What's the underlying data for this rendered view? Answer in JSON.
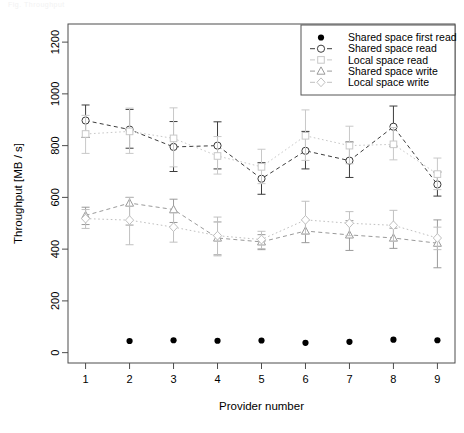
{
  "figure": {
    "ghost_header": "Fig.  Throughput",
    "width": 464,
    "height": 433,
    "background": "#ffffff"
  },
  "axes": {
    "x_label": "Provider number",
    "y_label": "Throughput [MB / s]",
    "x_ticks": [
      "1",
      "2",
      "3",
      "4",
      "5",
      "6",
      "7",
      "8",
      "9"
    ],
    "y_ticks": [
      "0",
      "200",
      "400",
      "600",
      "800",
      "1000",
      "1200"
    ]
  },
  "legend": {
    "items": [
      {
        "label": "Shared space first read",
        "marker": "filled-circle",
        "color": "#000000",
        "line": "none"
      },
      {
        "label": "Shared space read",
        "marker": "open-circle",
        "color": "#3c3c3c",
        "line": "dashed"
      },
      {
        "label": "Local space read",
        "marker": "open-square",
        "color": "#c8c8c8",
        "line": "dotted"
      },
      {
        "label": "Shared space write",
        "marker": "open-triangle",
        "color": "#9a9a9a",
        "line": "dashed"
      },
      {
        "label": "Local space write",
        "marker": "open-diamond",
        "color": "#c0c0c0",
        "line": "dotted"
      }
    ]
  },
  "chart_data": {
    "type": "line",
    "title": "",
    "xlabel": "Provider number",
    "ylabel": "Throughput [MB / s]",
    "x": [
      1,
      2,
      3,
      4,
      5,
      6,
      7,
      8,
      9
    ],
    "xlim": [
      0.6,
      9.4
    ],
    "ylim": [
      -40,
      1270
    ],
    "grid": false,
    "legend_position": "top-right",
    "series": [
      {
        "name": "Shared space first read",
        "marker": "filled-circle",
        "color": "#000000",
        "line": "none",
        "x": [
          2,
          3,
          4,
          5,
          6,
          7,
          8,
          9
        ],
        "values": [
          45,
          48,
          46,
          47,
          38,
          42,
          50,
          48
        ],
        "err_low": [
          0,
          0,
          0,
          0,
          0,
          0,
          0,
          0
        ],
        "err_high": [
          0,
          0,
          0,
          0,
          0,
          0,
          0,
          0
        ]
      },
      {
        "name": "Shared space read",
        "marker": "open-circle",
        "color": "#3c3c3c",
        "line": "dashed",
        "x": [
          1,
          2,
          3,
          4,
          5,
          6,
          7,
          8,
          9
        ],
        "values": [
          897,
          862,
          795,
          800,
          672,
          780,
          742,
          873,
          650
        ],
        "err_low": [
          65,
          72,
          95,
          90,
          60,
          70,
          65,
          75,
          45
        ],
        "err_high": [
          60,
          78,
          98,
          92,
          62,
          75,
          72,
          80,
          48
        ]
      },
      {
        "name": "Local space read",
        "marker": "open-square",
        "color": "#c8c8c8",
        "line": "dotted",
        "x": [
          1,
          2,
          3,
          4,
          5,
          6,
          7,
          8,
          9
        ],
        "values": [
          845,
          855,
          828,
          760,
          718,
          838,
          800,
          805,
          690
        ],
        "err_low": [
          75,
          85,
          110,
          70,
          65,
          95,
          70,
          60,
          60
        ],
        "err_high": [
          72,
          90,
          118,
          75,
          68,
          100,
          75,
          65,
          62
        ]
      },
      {
        "name": "Shared space write",
        "marker": "open-triangle",
        "color": "#9a9a9a",
        "line": "dashed",
        "x": [
          1,
          2,
          3,
          4,
          5,
          6,
          7,
          8,
          9
        ],
        "values": [
          530,
          578,
          553,
          443,
          428,
          470,
          455,
          443,
          423
        ],
        "err_low": [
          35,
          85,
          50,
          65,
          30,
          45,
          60,
          40,
          95
        ],
        "err_high": [
          32,
          22,
          40,
          62,
          28,
          42,
          55,
          38,
          90
        ]
      },
      {
        "name": "Local space write",
        "marker": "open-diamond",
        "color": "#c0c0c0",
        "line": "dotted",
        "x": [
          1,
          2,
          3,
          4,
          5,
          6,
          7,
          8,
          9
        ],
        "values": [
          518,
          512,
          485,
          452,
          437,
          513,
          500,
          492,
          443
        ],
        "err_low": [
          38,
          95,
          58,
          78,
          35,
          55,
          48,
          62,
          45
        ],
        "err_high": [
          35,
          88,
          55,
          72,
          32,
          72,
          45,
          58,
          42
        ]
      }
    ]
  }
}
